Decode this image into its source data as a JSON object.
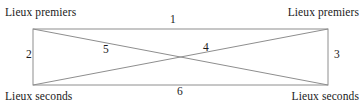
{
  "figure": {
    "type": "diagram",
    "shape": "rectangle-with-diagonals",
    "background_color": "#ffffff",
    "line_color": "#8e8e8e",
    "text_color": "#1a1a1a",
    "rect": {
      "x1": 33,
      "y1": 29,
      "x2": 328,
      "y2": 85
    },
    "corner_labels": {
      "top_left": "Lieux premiers",
      "top_right": "Lieux premiers",
      "bottom_left": "Lieux seconds",
      "bottom_right": "Lieux seconds"
    },
    "edge_labels": [
      {
        "id": "1",
        "text": "1",
        "describes": "top-edge"
      },
      {
        "id": "2",
        "text": "2",
        "describes": "left-edge"
      },
      {
        "id": "3",
        "text": "3",
        "describes": "right-edge"
      },
      {
        "id": "4",
        "text": "4",
        "describes": "diagonal-bottom-left-to-top-right"
      },
      {
        "id": "5",
        "text": "5",
        "describes": "diagonal-top-left-to-bottom-right"
      },
      {
        "id": "6",
        "text": "6",
        "describes": "bottom-edge"
      }
    ]
  }
}
